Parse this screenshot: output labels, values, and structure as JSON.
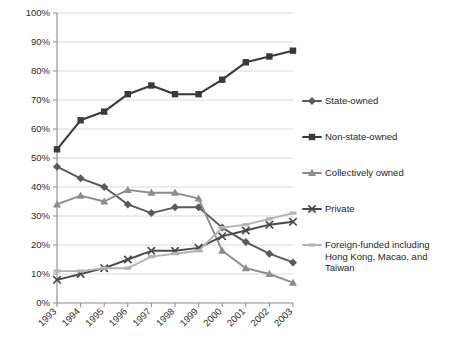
{
  "chart_data": {
    "type": "line",
    "title": "",
    "xlabel": "",
    "ylabel": "",
    "ylim": [
      0,
      100
    ],
    "ytick_suffix": "%",
    "grid": true,
    "legend_position": "right",
    "categories": [
      "1993",
      "1994",
      "1995",
      "1996",
      "1997",
      "1998",
      "1999",
      "2000",
      "2001",
      "2002",
      "2003"
    ],
    "yticks": [
      "0%",
      "10%",
      "20%",
      "30%",
      "40%",
      "50%",
      "60%",
      "70%",
      "80%",
      "90%",
      "100%"
    ],
    "ytick_values": [
      0,
      10,
      20,
      30,
      40,
      50,
      60,
      70,
      80,
      90,
      100
    ],
    "series": [
      {
        "name": "State-owned",
        "marker": "diamond",
        "color": "#595959",
        "values": [
          47,
          43,
          40,
          34,
          31,
          33,
          33,
          26,
          21,
          17,
          14
        ]
      },
      {
        "name": "Non-state-owned",
        "marker": "square",
        "color": "#3a3a3a",
        "values": [
          53,
          63,
          66,
          72,
          75,
          72,
          72,
          77,
          83,
          85,
          87
        ]
      },
      {
        "name": "Collectively owned",
        "marker": "triangle",
        "color": "#8c8c8c",
        "values": [
          34,
          37,
          35,
          39,
          38,
          38,
          36,
          18,
          12,
          10,
          7
        ]
      },
      {
        "name": "Private",
        "marker": "x",
        "color": "#4a4a4a",
        "values": [
          8,
          10,
          12,
          15,
          18,
          18,
          19,
          23,
          25,
          27,
          28
        ]
      },
      {
        "name": "Foreign-funded including Hong Kong, Macao, and Taiwan",
        "marker": "dash",
        "color": "#b3b3b3",
        "values": [
          11,
          11,
          12,
          12,
          16,
          17,
          18,
          26,
          27,
          29,
          31
        ]
      }
    ]
  },
  "legend": {
    "items": [
      {
        "label": "State-owned",
        "label_lines": [
          "State-owned"
        ]
      },
      {
        "label": "Non-state-owned",
        "label_lines": [
          "Non-state-owned"
        ]
      },
      {
        "label": "Collectively owned",
        "label_lines": [
          "Collectively owned"
        ]
      },
      {
        "label": "Private",
        "label_lines": [
          "Private"
        ]
      },
      {
        "label": "Foreign-funded including Hong Kong, Macao, and Taiwan",
        "label_lines": [
          "Foreign-funded including",
          "Hong Kong, Macao, and",
          "Taiwan"
        ]
      }
    ]
  },
  "colors": {
    "grid": "#d9d9d9",
    "axis": "#8a8a8a",
    "text": "#231f20",
    "background": "#ffffff"
  }
}
